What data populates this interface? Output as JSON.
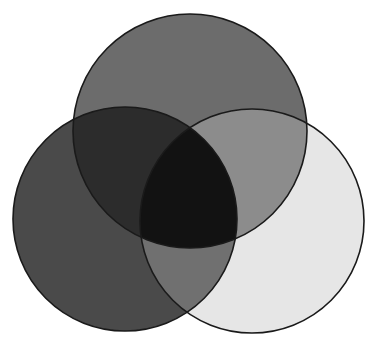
{
  "diagram": {
    "type": "venn",
    "sets": 3,
    "circles": [
      {
        "id": "top",
        "cx": 190,
        "cy": 131,
        "r": 117
      },
      {
        "id": "left",
        "cx": 125,
        "cy": 219,
        "r": 112
      },
      {
        "id": "right",
        "cx": 252,
        "cy": 221,
        "r": 112
      }
    ],
    "region_colors": {
      "top_only": "#6c6c6c",
      "left_only": "#4a4a4a",
      "right_only": "#e6e6e6",
      "top_left": "#2c2c2c",
      "top_right": "#8c8c8c",
      "left_right": "#707070",
      "all_three": "#121212"
    },
    "stroke_color": "#1a1a1a"
  }
}
